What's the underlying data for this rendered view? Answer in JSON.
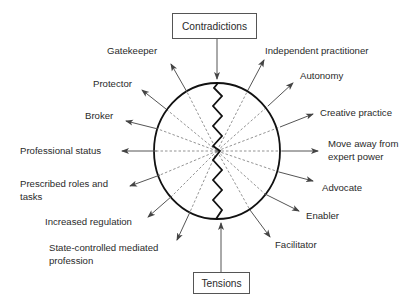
{
  "diagram": {
    "top_box": {
      "label": "Contradictions"
    },
    "bottom_box": {
      "label": "Tensions"
    },
    "left_labels": [
      {
        "text": "Gatekeeper"
      },
      {
        "text": "Protector"
      },
      {
        "text": "Broker"
      },
      {
        "text": "Professional status"
      },
      {
        "text": "Prescribed roles and tasks",
        "line1": "Prescribed roles and",
        "line2": "tasks"
      },
      {
        "text": "Increased regulation"
      },
      {
        "text": "State-controlled mediated profession",
        "line1": "State-controlled mediated",
        "line2": "profession"
      }
    ],
    "right_labels": [
      {
        "text": "Independent practitioner"
      },
      {
        "text": "Autonomy"
      },
      {
        "text": "Creative practice"
      },
      {
        "text": "Move away from expert power",
        "line1": "Move away from",
        "line2": "expert power"
      },
      {
        "text": "Advocate"
      },
      {
        "text": "Enabler"
      },
      {
        "text": "Facilitator"
      }
    ],
    "colors": {
      "ellipse_stroke": "#111111",
      "arrow": "#555555",
      "dashed": "#777777",
      "zigzag": "#111111"
    }
  }
}
